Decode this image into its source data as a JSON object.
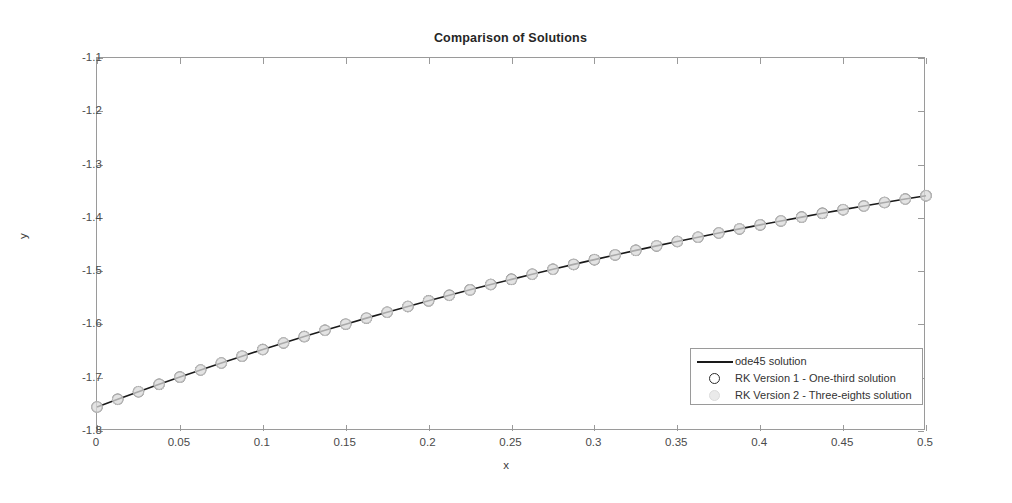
{
  "chart_data": {
    "type": "line",
    "title": "Comparison of Solutions",
    "xlabel": "x",
    "ylabel": "y",
    "xlim": [
      0,
      0.5
    ],
    "ylim": [
      -1.8,
      -1.1
    ],
    "grid": false,
    "legend_position": "lower right",
    "xticks": [
      "0",
      "0.05",
      "0.1",
      "0.15",
      "0.2",
      "0.25",
      "0.3",
      "0.35",
      "0.4",
      "0.45",
      "0.5"
    ],
    "xtick_values": [
      0,
      0.05,
      0.1,
      0.15,
      0.2,
      0.25,
      0.3,
      0.35,
      0.4,
      0.45,
      0.5
    ],
    "yticks": [
      "-1.8",
      "-1.7",
      "-1.6",
      "-1.5",
      "-1.4",
      "-1.3",
      "-1.2",
      "-1.1"
    ],
    "ytick_values": [
      -1.8,
      -1.7,
      -1.6,
      -1.5,
      -1.4,
      -1.3,
      -1.2,
      -1.1
    ],
    "series": [
      {
        "name": "ode45 solution",
        "style": "line",
        "color": "#1a1a1a",
        "x": [
          0,
          0.0125,
          0.025,
          0.0375,
          0.05,
          0.0625,
          0.075,
          0.0875,
          0.1,
          0.1125,
          0.125,
          0.1375,
          0.15,
          0.1625,
          0.175,
          0.1875,
          0.2,
          0.2125,
          0.225,
          0.2375,
          0.25,
          0.2625,
          0.275,
          0.2875,
          0.3,
          0.3125,
          0.325,
          0.3375,
          0.35,
          0.3625,
          0.375,
          0.3875,
          0.4,
          0.4125,
          0.425,
          0.4375,
          0.45,
          0.4625,
          0.475,
          0.4875,
          0.5
        ],
        "values": [
          -1.755,
          -1.7405,
          -1.7263,
          -1.7124,
          -1.6988,
          -1.6855,
          -1.6724,
          -1.6596,
          -1.6471,
          -1.6348,
          -1.6228,
          -1.611,
          -1.5995,
          -1.5882,
          -1.5771,
          -1.5663,
          -1.5557,
          -1.5453,
          -1.5351,
          -1.5251,
          -1.5154,
          -1.5058,
          -1.4965,
          -1.4873,
          -1.4784,
          -1.4696,
          -1.461,
          -1.4526,
          -1.4444,
          -1.4363,
          -1.4284,
          -1.4207,
          -1.4132,
          -1.4058,
          -1.3986,
          -1.3915,
          -1.3846,
          -1.3778,
          -1.3712,
          -1.3647,
          -1.3584
        ]
      },
      {
        "name": "RK Version 1 - One-third solution",
        "style": "marker",
        "marker": "circle-open",
        "color": "#2b2b2b",
        "x": [
          0,
          0.0125,
          0.025,
          0.0375,
          0.05,
          0.0625,
          0.075,
          0.0875,
          0.1,
          0.1125,
          0.125,
          0.1375,
          0.15,
          0.1625,
          0.175,
          0.1875,
          0.2,
          0.2125,
          0.225,
          0.2375,
          0.25,
          0.2625,
          0.275,
          0.2875,
          0.3,
          0.3125,
          0.325,
          0.3375,
          0.35,
          0.3625,
          0.375,
          0.3875,
          0.4,
          0.4125,
          0.425,
          0.4375,
          0.45,
          0.4625,
          0.475,
          0.4875,
          0.5
        ],
        "values": [
          -1.755,
          -1.7405,
          -1.7263,
          -1.7124,
          -1.6988,
          -1.6855,
          -1.6724,
          -1.6596,
          -1.6471,
          -1.6348,
          -1.6228,
          -1.611,
          -1.5995,
          -1.5882,
          -1.5771,
          -1.5663,
          -1.5557,
          -1.5453,
          -1.5351,
          -1.5251,
          -1.5154,
          -1.5058,
          -1.4965,
          -1.4873,
          -1.4784,
          -1.4696,
          -1.461,
          -1.4526,
          -1.4444,
          -1.4363,
          -1.4284,
          -1.4207,
          -1.4132,
          -1.4058,
          -1.3986,
          -1.3915,
          -1.3846,
          -1.3778,
          -1.3712,
          -1.3647,
          -1.3584
        ]
      },
      {
        "name": "RK Version 2 - Three-eights solution",
        "style": "marker",
        "marker": "circle-filled",
        "color": "#d9d9d9",
        "x": [
          0,
          0.0125,
          0.025,
          0.0375,
          0.05,
          0.0625,
          0.075,
          0.0875,
          0.1,
          0.1125,
          0.125,
          0.1375,
          0.15,
          0.1625,
          0.175,
          0.1875,
          0.2,
          0.2125,
          0.225,
          0.2375,
          0.25,
          0.2625,
          0.275,
          0.2875,
          0.3,
          0.3125,
          0.325,
          0.3375,
          0.35,
          0.3625,
          0.375,
          0.3875,
          0.4,
          0.4125,
          0.425,
          0.4375,
          0.45,
          0.4625,
          0.475,
          0.4875,
          0.5
        ],
        "values": [
          -1.755,
          -1.7405,
          -1.7263,
          -1.7124,
          -1.6988,
          -1.6855,
          -1.6724,
          -1.6596,
          -1.6471,
          -1.6348,
          -1.6228,
          -1.611,
          -1.5995,
          -1.5882,
          -1.5771,
          -1.5663,
          -1.5557,
          -1.5453,
          -1.5351,
          -1.5251,
          -1.5154,
          -1.5058,
          -1.4965,
          -1.4873,
          -1.4784,
          -1.4696,
          -1.461,
          -1.4526,
          -1.4444,
          -1.4363,
          -1.4284,
          -1.4207,
          -1.4132,
          -1.4058,
          -1.3986,
          -1.3915,
          -1.3846,
          -1.3778,
          -1.3712,
          -1.3647,
          -1.3584
        ]
      }
    ]
  },
  "legend": {
    "items": [
      {
        "label": "ode45 solution"
      },
      {
        "label": "RK Version 1 - One-third solution"
      },
      {
        "label": "RK Version 2 - Three-eights solution"
      }
    ]
  }
}
